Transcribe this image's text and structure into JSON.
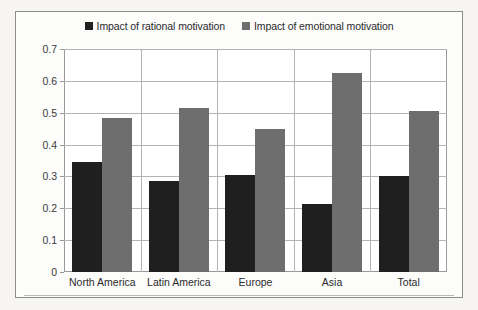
{
  "chart_data": {
    "type": "bar",
    "title": "",
    "xlabel": "",
    "ylabel": "",
    "categories": [
      "North America",
      "Latin America",
      "Europe",
      "Asia",
      "Total"
    ],
    "series": [
      {
        "name": "Impact of rational motivation",
        "color": "#1f1f1f",
        "values": [
          0.345,
          0.285,
          0.305,
          0.215,
          0.3
        ]
      },
      {
        "name": "Impact of emotional motivation",
        "color": "#6e6e6e",
        "values": [
          0.485,
          0.515,
          0.45,
          0.625,
          0.505
        ]
      }
    ],
    "ylim": [
      0,
      0.7
    ],
    "ytick_labels": [
      "0",
      "0.1",
      "0.2",
      "0.3",
      "0.4",
      "0.5",
      "0.6",
      "0.7"
    ],
    "ytick_values": [
      0,
      0.1,
      0.2,
      0.3,
      0.4,
      0.5,
      0.6,
      0.7
    ],
    "grid": "horizontal-and-vertical",
    "legend_position": "top-center"
  },
  "legend": {
    "entries": [
      {
        "label": "Impact of rational motivation",
        "swatch": "series-dark"
      },
      {
        "label": "Impact of emotional motivation",
        "swatch": "series-gray"
      }
    ]
  },
  "colors": {
    "series_rational": "#1f1f1f",
    "series_emotional": "#6e6e6e",
    "grid": "#b4b4b4",
    "frame": "#8d8d8d",
    "plot_background": "#ffffff",
    "page_background": "#f6f5f3"
  }
}
